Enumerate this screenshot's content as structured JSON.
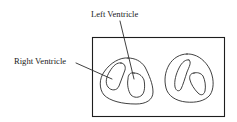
{
  "diagram": {
    "type": "anatomical-line-drawing",
    "labels": {
      "left_ventricle": "Left Ventricle",
      "right_ventricle": "Right Ventricle"
    },
    "colors": {
      "line": "#2b2b2b",
      "background": "#ffffff",
      "text": "#1a1a1a"
    }
  }
}
